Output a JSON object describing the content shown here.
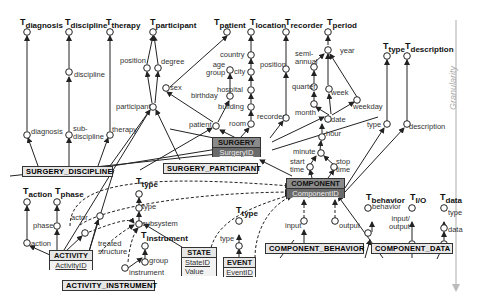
{
  "diagram": {
    "axis_label": "Granularity",
    "top_nodes": [
      {
        "id": "diagnosis",
        "base": "T",
        "sub": "diagnosis"
      },
      {
        "id": "discipline",
        "base": "T",
        "sub": "discipline"
      },
      {
        "id": "therapy",
        "base": "T",
        "sub": "therapy"
      },
      {
        "id": "participant",
        "base": "T",
        "sub": "participant"
      },
      {
        "id": "patient",
        "base": "T",
        "sub": "patient"
      },
      {
        "id": "location",
        "base": "T",
        "sub": "location"
      },
      {
        "id": "recorder",
        "base": "T",
        "sub": "recorder"
      },
      {
        "id": "period",
        "base": "T",
        "sub": "period"
      },
      {
        "id": "type",
        "base": "T",
        "sub": "type"
      },
      {
        "id": "description",
        "base": "T",
        "sub": "description"
      },
      {
        "id": "action",
        "base": "T",
        "sub": "action"
      },
      {
        "id": "phase",
        "base": "T",
        "sub": "phase"
      },
      {
        "id": "type2",
        "base": "T",
        "sub": "type"
      },
      {
        "id": "instrument",
        "base": "T",
        "sub": "instrument"
      },
      {
        "id": "type3",
        "base": "T",
        "sub": "type"
      },
      {
        "id": "behavior",
        "base": "T",
        "sub": "behavior"
      },
      {
        "id": "io",
        "base": "T",
        "sub": "I/O"
      },
      {
        "id": "data",
        "base": "T",
        "sub": "data"
      }
    ],
    "level_labels": {
      "discipline": "discipline",
      "diagnosis": "diagnosis",
      "subdiscipline": "sub-\ndiscipline",
      "therapy": "therapy",
      "position": "position",
      "degree": "degree",
      "participant": "participant",
      "sex": "sex",
      "age_group": "age\ngroup",
      "birthday": "birthday",
      "patient": "patient",
      "country": "country",
      "city": "city",
      "hospital": "hospital",
      "building": "building",
      "room": "room",
      "position2": "position",
      "recorder": "recorder",
      "semi_annual": "semi-\nannual",
      "year": "year",
      "quarter": "quarter",
      "week": "week",
      "month": "month",
      "weekday": "weekday",
      "date": "date",
      "hour": "hour",
      "minute": "minute",
      "start_time": "start\ntime",
      "stop_time": "stop\ntime",
      "type": "type",
      "description": "description",
      "phase": "phase",
      "action": "action",
      "actor": "actor",
      "treated_structure": "treated\nstructure",
      "type2": "type",
      "subsystem": "subsystem",
      "group": "group",
      "instrument": "instrument",
      "type3": "type",
      "input": "input",
      "output": "output",
      "behavior": "behavior",
      "input_output": "input/\noutput",
      "type4": "type",
      "data": "data"
    },
    "entities": {
      "surgery_discipline": "SURGERY_DISCIPLINE",
      "surgery": {
        "name": "SURGERY",
        "key": "SurgeryID"
      },
      "surgery_participant": "SURGERY_PARTICIPANT",
      "component": {
        "name": "COMPONENT",
        "key": "ComponentID"
      },
      "activity": {
        "name": "ACTIVITY",
        "key": "ActivityID"
      },
      "activity_instrument": "ACTIVITY_INSTRUMENT",
      "state": {
        "name": "STATE",
        "key": "StateID",
        "attr": "Value"
      },
      "event": {
        "name": "EVENT",
        "key": "EventID"
      },
      "component_behavior": "COMPONENT_BEHAVIOR",
      "component_data": "COMPONENT_DATA"
    }
  }
}
